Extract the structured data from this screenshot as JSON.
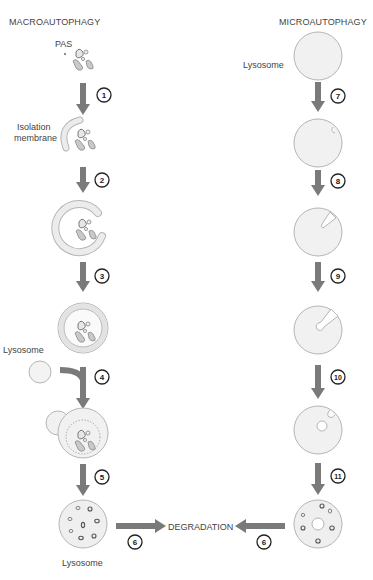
{
  "titles": {
    "left": "MACROAUTOPHAGY",
    "right": "MICROAUTOPHAGY"
  },
  "labels": {
    "pas": "PAS",
    "isolation_membrane_line1": "Isolation",
    "isolation_membrane_line2": "membrane",
    "lysosome_macro": "Lysosome",
    "lysosome_bottom": "Lysosome",
    "lysosome_micro": "Lysosome",
    "degradation": "DEGRADATION"
  },
  "steps": {
    "s1": "1",
    "s2": "2",
    "s3": "3",
    "s4": "4",
    "s5": "5",
    "s6_left": "6",
    "s6_right": "6",
    "s7": "7",
    "s8": "8",
    "s9": "9",
    "s10": "10",
    "s11": "11"
  },
  "colors": {
    "arrow": "#7a7a7a",
    "membrane_fill": "#ececec",
    "membrane_stroke": "#b5b5b5",
    "cargo_fill": "#d8d8d8",
    "cargo_stroke": "#777777"
  }
}
